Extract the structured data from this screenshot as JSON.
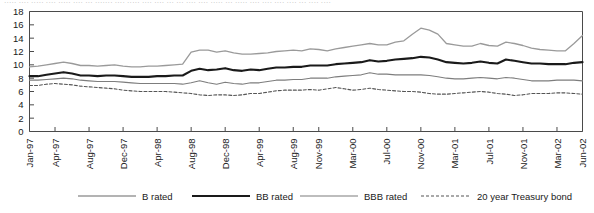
{
  "figure": {
    "clipped_caption": "····· ···· ····· ···· ····· ···· ··· ······· ···· ····· ···· ···· ··· ··· ···· ···· ····· ··· ····· ···· ···· ···· ···· ··· ···· ····",
    "background_color": "#ffffff"
  },
  "legend": {
    "position": "bottom",
    "items": [
      {
        "label": "B rated",
        "color": "#9a9a9a",
        "width": 1.3,
        "dash": "none"
      },
      {
        "label": "BB rated",
        "color": "#1a1a1a",
        "width": 2.1,
        "dash": "none"
      },
      {
        "label": "BBB rated",
        "color": "#7d7d7d",
        "width": 1.1,
        "dash": "none"
      },
      {
        "label": "20 year Treasury bond",
        "color": "#555555",
        "width": 1.1,
        "dash": "3,2"
      }
    ]
  },
  "chart_data": {
    "type": "line",
    "title": "",
    "subtitle": "",
    "xlabel": "",
    "ylabel": "",
    "ylim": [
      0,
      18
    ],
    "yticks": [
      0,
      2,
      4,
      6,
      8,
      10,
      12,
      14,
      16,
      18
    ],
    "grid": false,
    "x_tick_labels": [
      "Jan-97",
      "Apr-97",
      "Aug-97",
      "Dec-97",
      "Apr-98",
      "Aug-98",
      "Dec-98",
      "Apr-99",
      "Aug-99",
      "Nov-99",
      "Mar-00",
      "Jul-00",
      "Nov-00",
      "Mar-01",
      "Jul-01",
      "Nov-01",
      "Mar-02",
      "Jun-02"
    ],
    "x_tick_indices": [
      0,
      3,
      7,
      11,
      15,
      19,
      23,
      27,
      31,
      34,
      38,
      42,
      46,
      50,
      54,
      58,
      62,
      65
    ],
    "x": [
      "Jan-97",
      "Feb-97",
      "Mar-97",
      "Apr-97",
      "May-97",
      "Jun-97",
      "Jul-97",
      "Aug-97",
      "Sep-97",
      "Oct-97",
      "Nov-97",
      "Dec-97",
      "Jan-98",
      "Feb-98",
      "Mar-98",
      "Apr-98",
      "May-98",
      "Jun-98",
      "Jul-98",
      "Aug-98",
      "Sep-98",
      "Oct-98",
      "Nov-98",
      "Dec-98",
      "Jan-99",
      "Feb-99",
      "Mar-99",
      "Apr-99",
      "May-99",
      "Jun-99",
      "Jul-99",
      "Aug-99",
      "Sep-99",
      "Oct-99",
      "Nov-99",
      "Dec-99",
      "Jan-00",
      "Feb-00",
      "Mar-00",
      "Apr-00",
      "May-00",
      "Jun-00",
      "Jul-00",
      "Aug-00",
      "Sep-00",
      "Oct-00",
      "Nov-00",
      "Dec-00",
      "Jan-01",
      "Feb-01",
      "Mar-01",
      "Apr-01",
      "May-01",
      "Jun-01",
      "Jul-01",
      "Aug-01",
      "Sep-01",
      "Oct-01",
      "Nov-01",
      "Dec-01",
      "Jan-02",
      "Feb-02",
      "Mar-02",
      "Apr-02",
      "May-02",
      "Jun-02"
    ],
    "series": [
      {
        "name": "B rated",
        "color": "#9a9a9a",
        "width": 1.3,
        "dash": "none",
        "values": [
          9.7,
          9.8,
          10.0,
          10.2,
          10.4,
          10.2,
          9.9,
          9.9,
          9.8,
          9.9,
          10.0,
          9.8,
          9.7,
          9.7,
          9.8,
          9.8,
          9.9,
          10.0,
          10.1,
          11.9,
          12.2,
          12.2,
          11.9,
          12.1,
          11.8,
          11.6,
          11.6,
          11.7,
          11.8,
          12.0,
          12.1,
          12.2,
          12.1,
          12.4,
          12.3,
          12.1,
          12.4,
          12.6,
          12.8,
          13.0,
          13.2,
          13.0,
          13.0,
          13.4,
          13.6,
          14.6,
          15.5,
          15.2,
          14.6,
          13.2,
          13.0,
          12.8,
          12.8,
          13.2,
          12.9,
          12.8,
          13.4,
          13.2,
          12.9,
          12.5,
          12.3,
          12.2,
          12.1,
          12.1,
          13.2,
          14.4
        ]
      },
      {
        "name": "BB rated",
        "color": "#1a1a1a",
        "width": 2.1,
        "dash": "none",
        "values": [
          8.3,
          8.3,
          8.5,
          8.7,
          8.9,
          8.7,
          8.4,
          8.4,
          8.3,
          8.4,
          8.4,
          8.3,
          8.2,
          8.2,
          8.2,
          8.3,
          8.3,
          8.4,
          8.4,
          9.1,
          9.4,
          9.2,
          9.3,
          9.5,
          9.2,
          9.1,
          9.3,
          9.2,
          9.4,
          9.6,
          9.6,
          9.7,
          9.7,
          9.9,
          9.9,
          9.9,
          10.1,
          10.2,
          10.3,
          10.4,
          10.7,
          10.5,
          10.6,
          10.8,
          10.9,
          11.0,
          11.2,
          11.1,
          10.8,
          10.4,
          10.3,
          10.2,
          10.3,
          10.5,
          10.3,
          10.2,
          10.8,
          10.6,
          10.4,
          10.2,
          10.2,
          10.1,
          10.1,
          10.1,
          10.3,
          10.4
        ]
      },
      {
        "name": "BBB rated",
        "color": "#7d7d7d",
        "width": 1.1,
        "dash": "none",
        "values": [
          7.7,
          7.7,
          7.8,
          7.9,
          8.0,
          7.9,
          7.7,
          7.6,
          7.5,
          7.5,
          7.5,
          7.4,
          7.3,
          7.2,
          7.2,
          7.2,
          7.2,
          7.2,
          7.1,
          7.3,
          7.6,
          7.3,
          7.1,
          7.4,
          7.2,
          7.1,
          7.3,
          7.3,
          7.5,
          7.7,
          7.7,
          7.8,
          7.8,
          8.0,
          8.0,
          8.0,
          8.2,
          8.3,
          8.4,
          8.5,
          8.8,
          8.6,
          8.6,
          8.5,
          8.5,
          8.5,
          8.5,
          8.4,
          8.2,
          8.0,
          7.9,
          7.9,
          8.0,
          8.1,
          8.0,
          7.9,
          8.1,
          8.0,
          7.8,
          7.6,
          7.6,
          7.6,
          7.7,
          7.7,
          7.7,
          7.6
        ]
      },
      {
        "name": "20 year Treasury bond",
        "color": "#555555",
        "width": 1.1,
        "dash": "3,2",
        "values": [
          6.9,
          6.9,
          7.1,
          7.2,
          7.1,
          7.0,
          6.8,
          6.7,
          6.6,
          6.5,
          6.4,
          6.2,
          6.1,
          6.0,
          6.0,
          6.0,
          6.0,
          5.9,
          5.8,
          5.7,
          5.5,
          5.4,
          5.5,
          5.5,
          5.4,
          5.5,
          5.7,
          5.7,
          5.9,
          6.1,
          6.2,
          6.2,
          6.2,
          6.3,
          6.2,
          6.4,
          6.6,
          6.4,
          6.2,
          6.3,
          6.5,
          6.3,
          6.2,
          6.1,
          6.0,
          6.0,
          5.9,
          5.7,
          5.6,
          5.6,
          5.7,
          5.8,
          5.9,
          6.0,
          5.9,
          5.7,
          5.6,
          5.4,
          5.5,
          5.7,
          5.7,
          5.7,
          5.8,
          5.8,
          5.7,
          5.6
        ]
      }
    ]
  }
}
